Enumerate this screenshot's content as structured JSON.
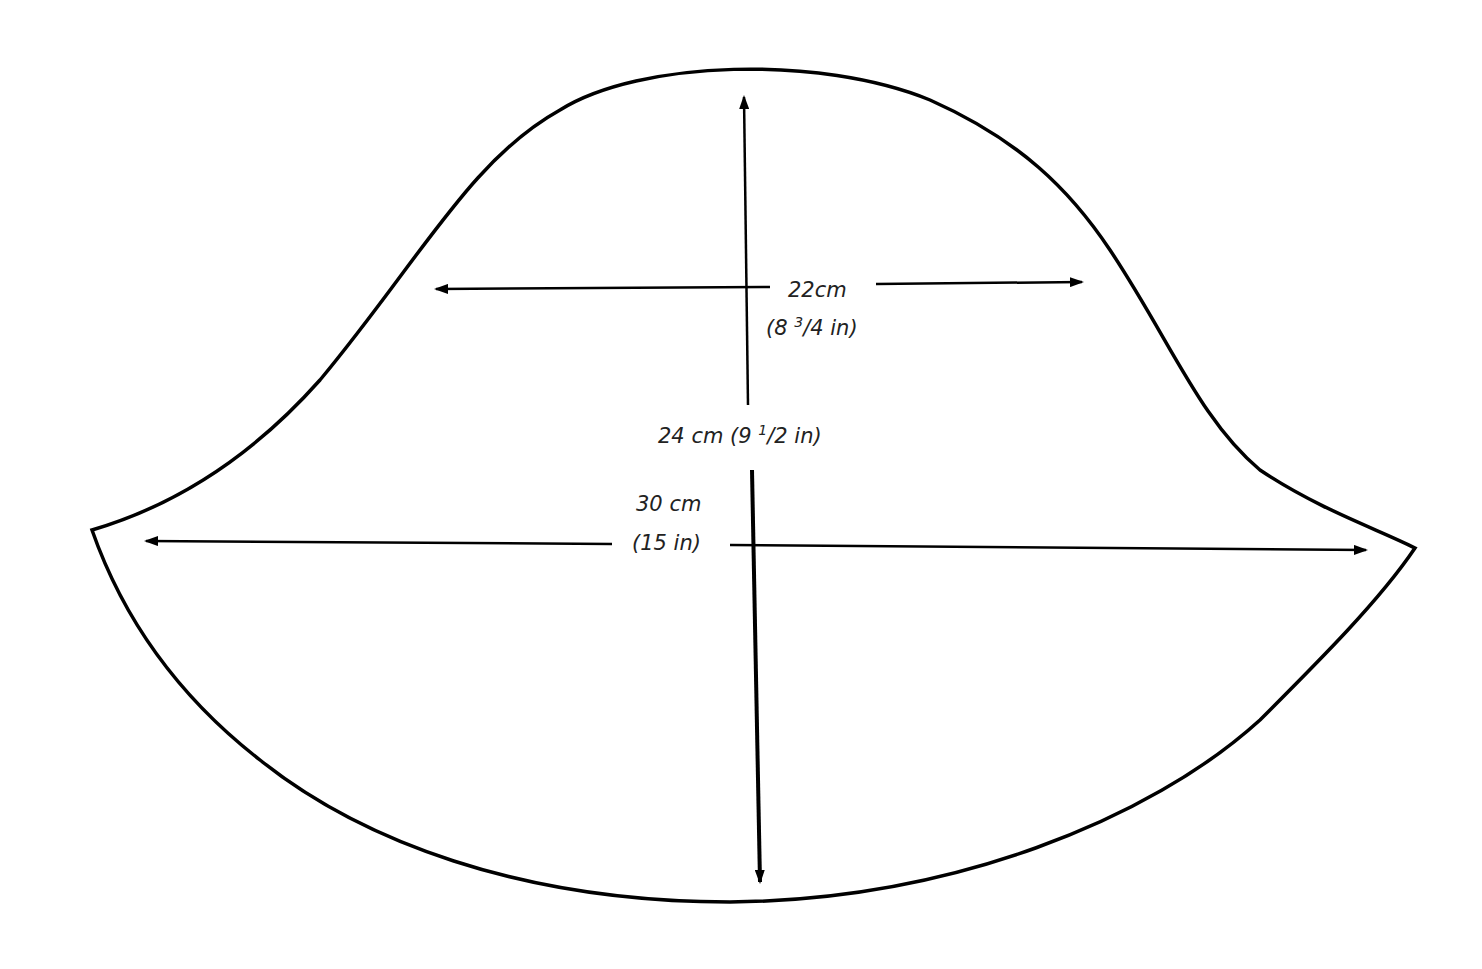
{
  "diagram": {
    "type": "sewing pattern piece (hat/crown shape)",
    "measurements": {
      "upper_width": {
        "cm": "22cm",
        "in": "(8 3/4 in)",
        "in_whole": "(8 ",
        "in_num": "3",
        "in_den": "4 in)"
      },
      "height": {
        "label": "24 cm (9 ",
        "in_num": "1",
        "in_den": "2 in)"
      },
      "lower_width": {
        "cm": "30 cm",
        "in": "(15 in)"
      }
    },
    "colors": {
      "line": "#000000",
      "background": "#ffffff",
      "text": "#222222"
    }
  }
}
